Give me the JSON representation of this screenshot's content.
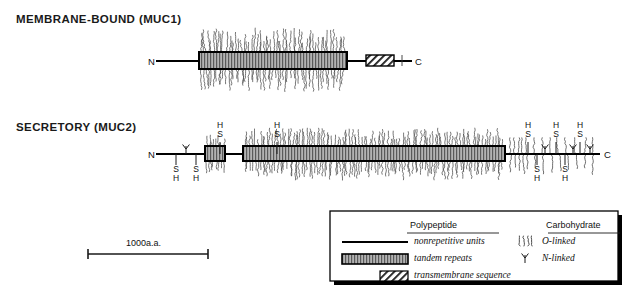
{
  "figure": {
    "kind": "mucin-domain-structure-diagram",
    "panels": [
      {
        "id": "muc1",
        "title": "MEMBRANE-BOUND (MUC1)",
        "n_terminus_label": "N",
        "c_terminus_label": "C"
      },
      {
        "id": "muc2",
        "title": "SECRETORY (MUC2)",
        "n_terminus_label": "N",
        "c_terminus_label": "C"
      }
    ]
  },
  "muc1": {
    "title": "MEMBRANE-BOUND (MUC1)",
    "n_label": "N",
    "c_label": "C",
    "backbone": {
      "x1": 156,
      "x2": 412,
      "y": 61
    },
    "tandem_repeat_box": {
      "x": 199,
      "y": 52,
      "w": 148,
      "h": 17
    },
    "transmembrane_box": {
      "x": 366,
      "y": 55,
      "w": 28,
      "h": 11
    },
    "o_linked_field": {
      "x1": 201,
      "x2": 345,
      "y": 61,
      "up": 28,
      "down": 26
    },
    "o_linked_tick": {
      "x": 402,
      "y": 61
    }
  },
  "muc2": {
    "title": "SECRETORY (MUC2)",
    "n_label": "N",
    "c_label": "C",
    "backbone": {
      "x1": 156,
      "x2": 600,
      "y": 154
    },
    "tandem_repeat_boxes": [
      {
        "x": 205,
        "y": 146,
        "w": 20,
        "h": 15
      },
      {
        "x": 243,
        "y": 146,
        "w": 262,
        "h": 15
      }
    ],
    "o_linked_dense": [
      {
        "x1": 206,
        "x2": 224,
        "up": 16,
        "down": 16
      },
      {
        "x1": 245,
        "x2": 503,
        "up": 22,
        "down": 22
      }
    ],
    "cysteine_labels_above": [
      {
        "x": 220,
        "text_top": "H",
        "text_bottom": "S"
      },
      {
        "x": 277,
        "text_top": "H",
        "text_bottom": "S"
      },
      {
        "x": 528,
        "text_top": "H",
        "text_bottom": "S"
      },
      {
        "x": 556,
        "text_top": "H",
        "text_bottom": "S"
      },
      {
        "x": 580,
        "text_top": "H",
        "text_bottom": "S"
      }
    ],
    "cysteine_labels_below": [
      {
        "x": 176,
        "text_top": "S",
        "text_bottom": "H"
      },
      {
        "x": 196,
        "text_top": "S",
        "text_bottom": "H"
      },
      {
        "x": 537,
        "text_top": "S",
        "text_bottom": "H"
      },
      {
        "x": 565,
        "text_top": "S",
        "text_bottom": "H"
      }
    ],
    "n_linked_positions": [
      186,
      545,
      573,
      590
    ],
    "o_linked_sparse_positions": [
      510,
      514,
      518,
      522,
      526,
      534,
      542,
      550,
      558,
      566,
      575,
      584,
      592
    ]
  },
  "scale_bar": {
    "label": "1000a.a.",
    "x1": 88,
    "x2": 208,
    "y": 254
  },
  "legend": {
    "box": {
      "x": 330,
      "y": 211,
      "w": 288,
      "h": 70
    },
    "columns": [
      {
        "header": "Polypeptide",
        "items": [
          {
            "key": "nonrepetitive",
            "label": "nonrepetitive units",
            "swatch": "solid-line"
          },
          {
            "key": "tandem",
            "label": "tandem repeats",
            "swatch": "hatched-box"
          },
          {
            "key": "transmembrane",
            "label": "transmembrane sequence",
            "swatch": "diagonal-box"
          }
        ]
      },
      {
        "header": "Carbohydrate",
        "items": [
          {
            "key": "o-linked",
            "label": "O-linked",
            "swatch": "o-linked-strokes"
          },
          {
            "key": "n-linked",
            "label": "N-linked",
            "swatch": "n-linked-glyph"
          }
        ]
      }
    ]
  },
  "colors": {
    "ink": "#000000",
    "text": "#111111",
    "glycan": "#4a4a4a",
    "box_fill": "#9a9a9a",
    "background": "#ffffff"
  }
}
